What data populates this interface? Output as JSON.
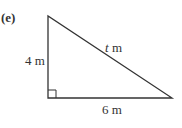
{
  "problem": {
    "part_label": "(e)"
  },
  "triangle": {
    "type": "right-triangle",
    "vertices": {
      "top": [
        48,
        16
      ],
      "right_angle": [
        48,
        98
      ],
      "bottom_right": [
        172,
        98
      ]
    },
    "right_angle_marker_size": 8,
    "stroke_color": "#333333",
    "sides": {
      "vertical": {
        "value": "4",
        "unit": " m",
        "label": "4 m"
      },
      "horizontal": {
        "value": "6",
        "unit": " m",
        "label": "6 m"
      },
      "hypotenuse": {
        "variable": "t",
        "unit": " m",
        "label": "t m"
      }
    }
  }
}
